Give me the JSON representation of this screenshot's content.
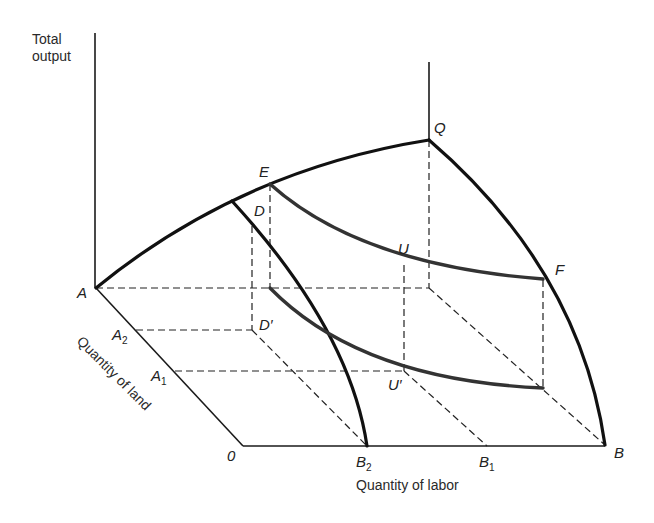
{
  "diagram": {
    "type": "3d-production-surface",
    "axes": {
      "vertical_label_line1": "Total",
      "vertical_label_line2": "output",
      "land_label": "Quantity of land",
      "labor_label": "Quantity of labor"
    },
    "points": {
      "origin": "0",
      "A": "A",
      "A1": "A",
      "A1_sub": "1",
      "A2": "A",
      "A2_sub": "2",
      "B": "B",
      "B1": "B",
      "B1_sub": "1",
      "B2": "B",
      "B2_sub": "2",
      "Q": "Q",
      "E": "E",
      "D": "D",
      "D_prime": "D′",
      "U": "U",
      "U_prime": "U′",
      "F": "F"
    },
    "colors": {
      "stroke": "#111111",
      "curve_gray": "#333333",
      "background": "#ffffff"
    }
  }
}
